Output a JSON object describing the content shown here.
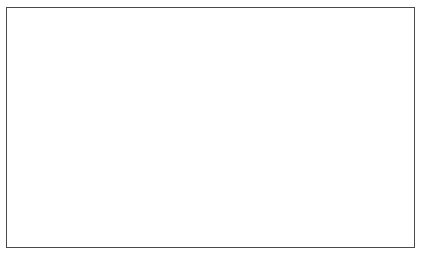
{
  "figure": {
    "border_color": "#4a4a4a",
    "background_color": "#ffffff"
  },
  "chart_data": {
    "type": "line",
    "title": "",
    "xlabel": "Year",
    "ylabel": "Dividend–price ratio",
    "x": [
      1990,
      1991,
      1992,
      1993,
      1994,
      1995,
      1996,
      1997,
      1998
    ],
    "values": [
      3.75,
      3.37,
      3.13,
      2.89,
      2.93,
      2.72,
      2.25,
      1.86,
      1.55
    ],
    "series": [
      {
        "name": "Dividend–price ratio",
        "values": [
          3.75,
          3.37,
          3.13,
          2.89,
          2.93,
          2.72,
          2.25,
          1.86,
          1.55
        ]
      }
    ],
    "categories": [
      "1990",
      "1991",
      "1992",
      "1993",
      "1994",
      "1995",
      "1996",
      "1997",
      "1998"
    ],
    "xtick_labels": [
      "1990",
      "1991",
      "1992",
      "1993",
      "1994",
      "1995",
      "1996",
      "1997",
      "1998"
    ],
    "ytick_labels": [
      "1.4",
      "1.6",
      "1.8",
      "2.0",
      "2.2",
      "2.4",
      "2.6",
      "2.8",
      "3.0",
      "3.2",
      "3.4",
      "3.6",
      "3.8"
    ],
    "yticks": [
      1.4,
      1.6,
      1.8,
      2.0,
      2.2,
      2.4,
      2.6,
      2.8,
      3.0,
      3.2,
      3.4,
      3.6,
      3.8
    ],
    "ylim": [
      1.4,
      3.8
    ],
    "xlim": [
      1989.5,
      1998.5
    ],
    "grid": false,
    "legend": false,
    "legend_position": "none",
    "line_color": "#8a8a8a",
    "line_width": 2.1
  }
}
